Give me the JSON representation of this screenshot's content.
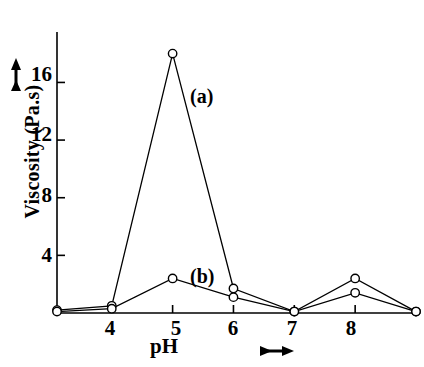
{
  "chart_data": {
    "type": "line",
    "title": "",
    "xlabel": "pH",
    "ylabel": "Viscosity (Pa.s)",
    "xlim": [
      3.1,
      9.0
    ],
    "ylim": [
      0,
      19.5
    ],
    "x_ticks": [
      4,
      5,
      6,
      7,
      8
    ],
    "x_tick_labels": [
      "4",
      "5",
      "6",
      "7",
      "8"
    ],
    "y_ticks": [
      4,
      8,
      12,
      16
    ],
    "y_tick_labels": [
      "4",
      "8",
      "12",
      "16"
    ],
    "grid": false,
    "legend": "inline annotations",
    "marker": "open-circle",
    "series": [
      {
        "name": "(a)",
        "label": "(a)",
        "x": [
          3.1,
          4,
          5,
          6,
          7,
          8,
          9
        ],
        "values": [
          0.2,
          0.5,
          18.0,
          1.7,
          0.1,
          2.4,
          0.1
        ]
      },
      {
        "name": "(b)",
        "label": "(b)",
        "x": [
          3.1,
          4,
          5,
          6,
          7,
          8,
          9
        ],
        "values": [
          0.1,
          0.3,
          2.4,
          1.1,
          0.1,
          1.4,
          0.1
        ]
      }
    ],
    "annotations": [
      {
        "text": "(a)",
        "x": 5.35,
        "y": 14.2
      },
      {
        "text": "(b)",
        "x": 5.5,
        "y": 2.6
      }
    ],
    "axis_arrows": {
      "y": "up-arrow",
      "x": "right-arrow"
    }
  },
  "axes": {
    "y_title": "Viscosity (Pa.s)",
    "x_title": "pH",
    "y_tick_labels": [
      "16",
      "12",
      "8",
      "4"
    ],
    "x_tick_labels": [
      "4",
      "5",
      "6",
      "7",
      "8"
    ]
  },
  "labels": {
    "series_a": "(a)",
    "series_b": "(b)"
  },
  "colors": {
    "line": "#000000",
    "marker_stroke": "#000000",
    "marker_fill": "#ffffff",
    "axis": "#000000",
    "background": "#ffffff"
  }
}
